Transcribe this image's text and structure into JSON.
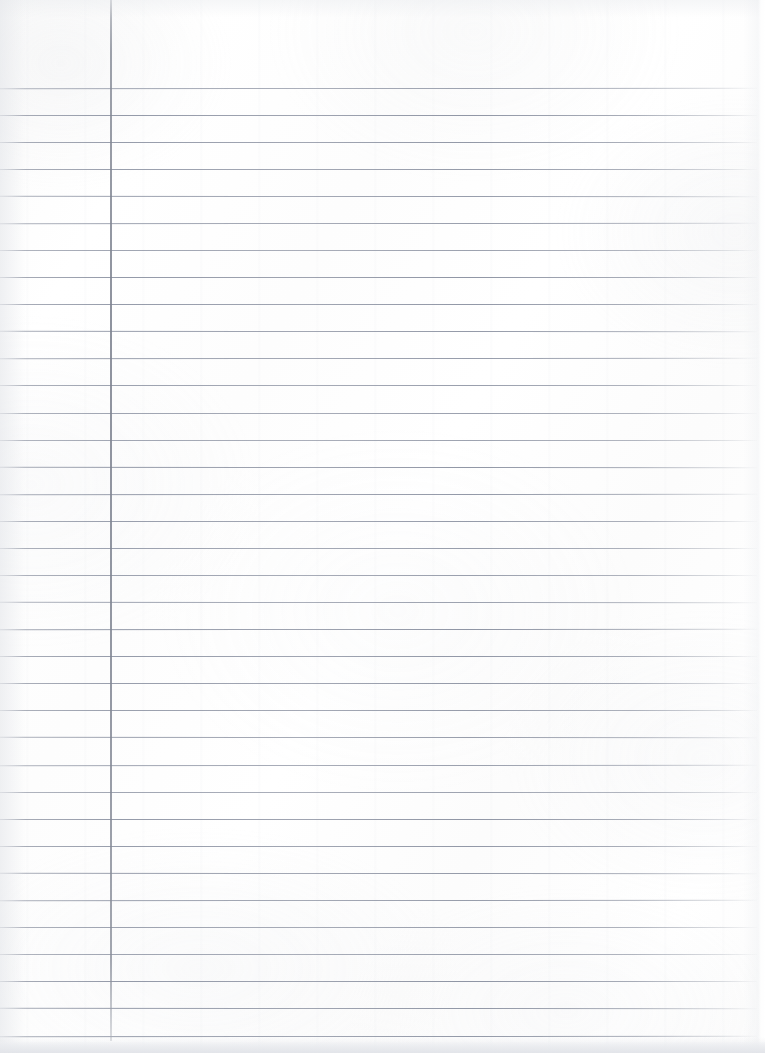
{
  "document": {
    "kind": "lined-notebook-paper",
    "title": "Blank Ruled Notebook Page",
    "content_text": "",
    "width_px": 765,
    "height_px": 1053,
    "background_color": "#fdfdfd"
  },
  "ruling": {
    "line_color": "#838a9b",
    "line_count": 36,
    "first_line_y": 88,
    "line_spacing_px": 27.05,
    "line_thickness_px": 1,
    "line_start_x": 0,
    "line_end_x": 757,
    "lines_y": [
      88,
      115,
      142,
      169,
      196,
      223,
      250,
      277,
      304,
      331,
      358,
      385,
      413,
      440,
      467,
      494,
      521,
      548,
      575,
      602,
      629,
      656,
      683,
      710,
      737,
      765,
      792,
      819,
      846,
      873,
      900,
      927,
      954,
      981,
      1008,
      1036
    ]
  },
  "margin_rule": {
    "color": "#7f8491",
    "x_px": 110,
    "width_px": 2,
    "top_y": 0,
    "bottom_y": 1041
  },
  "regions": {
    "left_margin_label": "left margin column",
    "writing_area_label": "writing area",
    "header_area_label": "header area above first rule"
  }
}
